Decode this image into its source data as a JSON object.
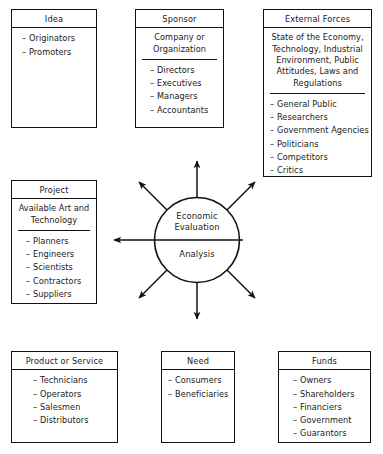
{
  "diagram": {
    "center": {
      "line1": "Economic",
      "line2": "Evaluation",
      "line3": "Analysis"
    },
    "boxes": [
      {
        "id": "idea",
        "title": "Idea",
        "subtitle": null,
        "items": [
          "Originators",
          "Promoters"
        ]
      },
      {
        "id": "sponsor",
        "title": "Sponsor",
        "subtitle": "Company or\nOrganization",
        "subtitle_lines": [
          "Company or",
          "Organization"
        ],
        "items": [
          "Directors",
          "Executives",
          "Managers",
          "Accountants"
        ]
      },
      {
        "id": "external-forces",
        "title": "External Forces",
        "subtitle_lines": [
          "State of the Economy,",
          "Technology, Industrial",
          "Environment, Public",
          "Attitudes, Laws and",
          "Regulations"
        ],
        "items": [
          "General Public",
          "Researchers",
          "Government Agencies",
          "Politicians",
          "Competitors",
          "Critics"
        ]
      },
      {
        "id": "project",
        "title": "Project",
        "subtitle_lines": [
          "Available Art and",
          "Technology"
        ],
        "items": [
          "Planners",
          "Engineers",
          "Scientists",
          "Contractors",
          "Suppliers"
        ]
      },
      {
        "id": "product-or-service",
        "title": "Product or Service",
        "subtitle": null,
        "items": [
          "Technicians",
          "Operators",
          "Salesmen",
          "Distributors"
        ]
      },
      {
        "id": "need",
        "title": "Need",
        "subtitle": null,
        "items": [
          "Consumers",
          "Beneficiaries"
        ]
      },
      {
        "id": "funds",
        "title": "Funds",
        "subtitle": null,
        "items": [
          "Owners",
          "Shareholders",
          "Financiers",
          "Government",
          "Guarantors"
        ]
      }
    ],
    "bullet": "–",
    "colors": {
      "stroke": "#111111",
      "background": "#ffffff",
      "text": "#1a1a1a"
    },
    "arrows": {
      "count": 7,
      "directions": [
        "up",
        "up-left",
        "up-right",
        "left",
        "down",
        "down-left",
        "down-right"
      ]
    }
  }
}
